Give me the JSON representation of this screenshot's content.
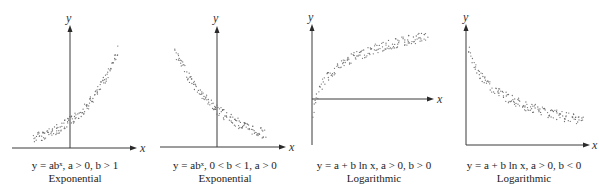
{
  "figure": {
    "panels": [
      {
        "id": "exp-growth",
        "equation": "y = abˣ, a > 0, b > 1",
        "type_label": "Exponential",
        "x_axis_label": "x",
        "y_axis_label": "y",
        "trend": "increasing exponential"
      },
      {
        "id": "exp-decay",
        "equation": "y = abˣ, 0 < b < 1, a > 0",
        "type_label": "Exponential",
        "x_axis_label": "x",
        "y_axis_label": "y",
        "trend": "decreasing exponential"
      },
      {
        "id": "log-increasing",
        "equation": "y = a + b ln x, a > 0, b > 0",
        "type_label": "Logarithmic",
        "x_axis_label": "x",
        "y_axis_label": "y",
        "trend": "increasing logarithmic"
      },
      {
        "id": "log-decreasing",
        "equation": "y = a + b ln x, a > 0, b < 0",
        "type_label": "Logarithmic",
        "x_axis_label": "x",
        "y_axis_label": "y",
        "trend": "decreasing logarithmic"
      }
    ]
  },
  "colors": {
    "axis": "#3a3a3a",
    "points": "#6f6f6f",
    "background": "#ffffff"
  }
}
